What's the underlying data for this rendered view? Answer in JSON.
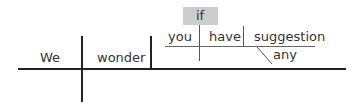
{
  "diagram": {
    "type": "sentence-diagram",
    "main_clause": {
      "subject": "We",
      "verb": "wonder"
    },
    "subordinate_clause": {
      "conjunction": "if",
      "subject": "you",
      "verb": "have",
      "object": "suggestion",
      "modifier": "any"
    },
    "colors": {
      "line": "#222222",
      "text": "#333333",
      "conjunction_box": "#cccccc"
    }
  }
}
